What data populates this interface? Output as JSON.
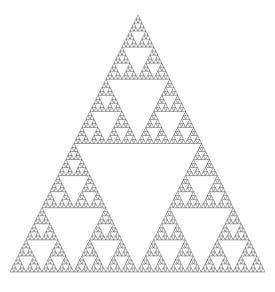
{
  "figure": {
    "title": "Sierpinski Triangle",
    "type": "fractal",
    "background_color": "#ffffff",
    "ink_color": "#2b2b2b",
    "canvas": {
      "width": 275,
      "height": 292
    }
  },
  "chart_data": {
    "type": "scatter",
    "title": "Sierpinski Triangle",
    "subtitle": "",
    "xlabel": "",
    "ylabel": "",
    "xlim": [
      0,
      275
    ],
    "ylim": [
      0,
      292
    ],
    "grid": false,
    "legend": "none",
    "annotations": [],
    "tick_labels_x": [],
    "tick_labels_y": [],
    "geometry": {
      "shape": "equilateral-triangle",
      "apex": [
        138,
        15
      ],
      "left_vertex": [
        10,
        272
      ],
      "right_vertex": [
        265,
        272
      ],
      "base_width": 255,
      "height": 257,
      "recursion_depth": 6,
      "subdivision_rule": "midpoint-removal",
      "removed_center_count_per_level": 1,
      "children_per_level": 3,
      "total_filled_triangles": 729
    },
    "series": [
      {
        "name": "Sierpinski gasket",
        "color": "#2b2b2b",
        "values": [
          729
        ]
      }
    ]
  }
}
